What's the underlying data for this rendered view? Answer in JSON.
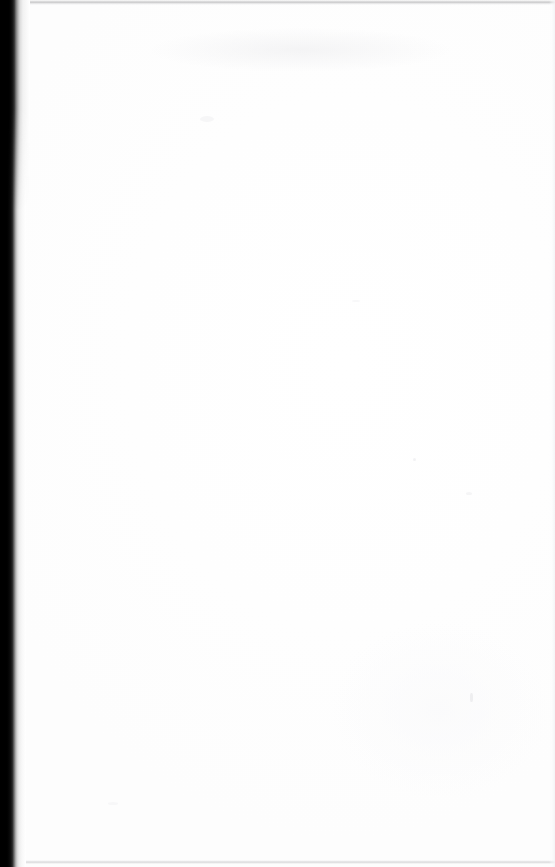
{
  "document": {
    "kind": "scanned-page",
    "content_state": "blank",
    "visible_text": "",
    "page_width_px": 555,
    "page_height_px": 867
  },
  "appearance": {
    "paper_color": "#ffffff",
    "paper_tint": "#fdfdfd",
    "gutter_shadow_color": "#000000",
    "gutter_falloff_color": "#d4d4d4",
    "scan_edge_color": "#969698",
    "right_edge_color": "#f3f3f5",
    "speck_color": "#f1f1f3"
  },
  "regions": {
    "gutter_label": "",
    "top_edge_label": "",
    "bottom_edge_label": "",
    "right_edge_label": "",
    "page_body_label": ""
  }
}
